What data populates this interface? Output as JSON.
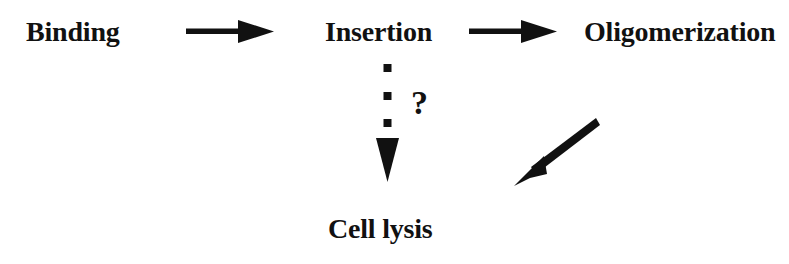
{
  "diagram": {
    "background_color": "#ffffff",
    "ink_color": "#111111",
    "width": 789,
    "height": 264,
    "nodes": [
      {
        "id": "binding",
        "label": "Binding"
      },
      {
        "id": "insertion",
        "label": "Insertion"
      },
      {
        "id": "oligomerization",
        "label": "Oligomerization"
      },
      {
        "id": "cell_lysis",
        "label": "Cell lysis"
      }
    ],
    "edges": [
      {
        "id": "binding_to_insertion",
        "from": "binding",
        "to": "insertion",
        "style": "solid",
        "direction": "right"
      },
      {
        "id": "insertion_to_oligomerization",
        "from": "insertion",
        "to": "oligomerization",
        "style": "solid",
        "direction": "right"
      },
      {
        "id": "insertion_to_cell_lysis",
        "from": "insertion",
        "to": "cell_lysis",
        "style": "dotted",
        "direction": "down",
        "annotation": "?"
      },
      {
        "id": "oligomerization_to_cell_lysis",
        "from": "oligomerization",
        "to": "cell_lysis",
        "style": "solid",
        "direction": "down-left"
      }
    ],
    "annotations": [
      {
        "id": "uncertainty",
        "text": "?",
        "attached_to": "insertion_to_cell_lysis"
      }
    ]
  }
}
